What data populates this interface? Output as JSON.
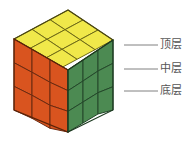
{
  "figure": {
    "title": "",
    "background_color": "#ffffff"
  },
  "cube": {
    "size": "3x3x3",
    "faces": {
      "top": {
        "name": "top-face",
        "color": "#F0E84A",
        "edge_color": "#6E6A16",
        "rows": 3,
        "cols": 3
      },
      "left": {
        "name": "left-face",
        "color": "#D9541F",
        "edge_color": "#6B2A10",
        "rows": 3,
        "cols": 3
      },
      "right": {
        "name": "right-face",
        "color": "#4C8A52",
        "edge_color": "#24482A",
        "rows": 3,
        "cols": 3
      }
    },
    "geometry": {
      "apex": [
        68,
        10
      ],
      "left_corner": [
        14,
        39
      ],
      "right_corner": [
        113,
        40
      ],
      "front_corner": [
        68,
        70
      ],
      "front_bottom": [
        68,
        132
      ],
      "left_bottom": [
        14,
        110
      ],
      "right_bottom": [
        113,
        110
      ]
    }
  },
  "annotations": {
    "leader_color": "#808080",
    "items": [
      {
        "id": "top-layer",
        "label": "顶层",
        "leader_start_x": 124,
        "leader_end_x": 158,
        "leader_y": 45
      },
      {
        "id": "middle-layer",
        "label": "中层",
        "leader_start_x": 124,
        "leader_end_x": 158,
        "leader_y": 69
      },
      {
        "id": "bottom-layer",
        "label": "底层",
        "leader_start_x": 124,
        "leader_end_x": 158,
        "leader_y": 91
      }
    ]
  }
}
